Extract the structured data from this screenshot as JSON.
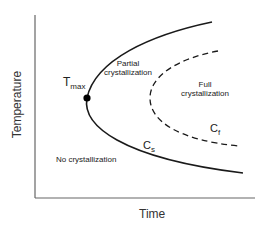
{
  "diagram": {
    "axes": {
      "x_label": "Time",
      "y_label": "Temperature"
    },
    "regions": {
      "partial_line1": "Partial",
      "partial_line2": "crystallization",
      "full_line1": "Full",
      "full_line2": "crystallization",
      "none": "No crystallization"
    },
    "curves": {
      "solid_label_main": "C",
      "solid_label_sub": "s",
      "dashed_label_main": "C",
      "dashed_label_sub": "f"
    },
    "point": {
      "label_main": "T",
      "label_sub": "max"
    },
    "colors": {
      "line": "#1a1a1a",
      "axis": "#555555",
      "background": "#ffffff"
    }
  }
}
